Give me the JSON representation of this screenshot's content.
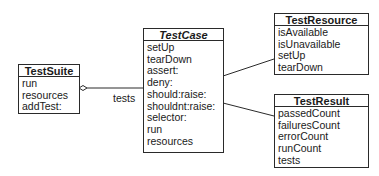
{
  "diagram": {
    "type": "uml-class-diagram",
    "classes": [
      {
        "id": "testsuite",
        "name": "TestSuite",
        "abstract": false,
        "members": [
          "run",
          "resources",
          "addTest:"
        ]
      },
      {
        "id": "testcase",
        "name": "TestCase",
        "abstract": true,
        "members": [
          "setUp",
          "tearDown",
          "assert:",
          "deny:",
          "should:raise:",
          "shouldnt:raise:",
          "selector:",
          "run",
          "resources"
        ]
      },
      {
        "id": "testresource",
        "name": "TestResource",
        "abstract": false,
        "members": [
          "isAvailable",
          "isUnavailable",
          "setUp",
          "tearDown"
        ]
      },
      {
        "id": "testresult",
        "name": "TestResult",
        "abstract": false,
        "members": [
          "passedCount",
          "failuresCount",
          "errorCount",
          "runCount",
          "tests"
        ]
      }
    ],
    "relations": [
      {
        "from": "TestSuite",
        "to": "TestCase",
        "kind": "aggregation",
        "label": "tests"
      },
      {
        "from": "TestCase",
        "to": "TestResource",
        "kind": "association",
        "label": ""
      },
      {
        "from": "TestCase",
        "to": "TestResult",
        "kind": "association",
        "label": ""
      }
    ],
    "colors": {
      "line": "#2a2a2a",
      "background": "#ffffff",
      "text": "#1a1a1a"
    }
  }
}
